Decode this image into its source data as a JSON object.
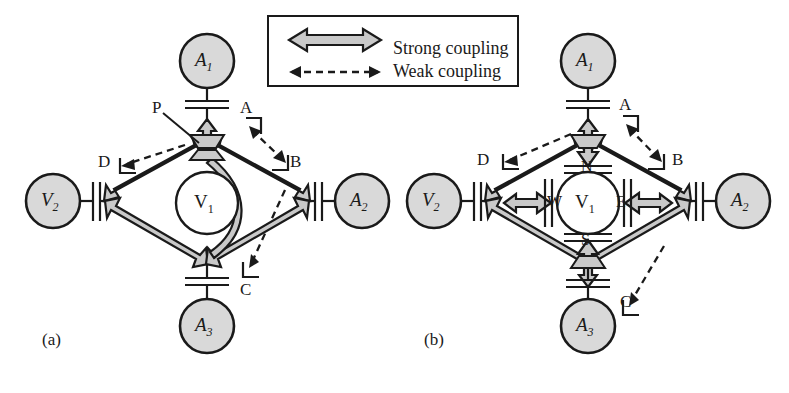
{
  "figure": {
    "type": "circuit-coupling-diagram",
    "panels": [
      {
        "id": "a",
        "panel_label": "(a)",
        "center_node": "V1",
        "center_node_label": "V",
        "center_node_sub": "1",
        "description": "All four corner ports converge on a single common plate P at the top hub",
        "nodes": [
          {
            "id": "A1",
            "label": "A",
            "sub": "1",
            "position": "top",
            "fill": "#d9d9d9"
          },
          {
            "id": "A2",
            "label": "A",
            "sub": "2",
            "position": "right",
            "fill": "#d9d9d9"
          },
          {
            "id": "A3",
            "label": "A",
            "sub": "3",
            "position": "bottom",
            "fill": "#d9d9d9"
          },
          {
            "id": "V2",
            "label": "V",
            "sub": "2",
            "position": "left",
            "fill": "#d9d9d9"
          }
        ],
        "ports": [
          {
            "id": "A",
            "label": "A",
            "position": "top-right"
          },
          {
            "id": "B",
            "label": "B",
            "position": "right-upper"
          },
          {
            "id": "C",
            "label": "C",
            "position": "bottom-right"
          },
          {
            "id": "D",
            "label": "D",
            "position": "left-upper"
          },
          {
            "id": "P",
            "label": "P",
            "position": "hub-top-left"
          }
        ],
        "strong_couplings": [
          {
            "from": "hub",
            "to": "D"
          },
          {
            "from": "hub",
            "to": "B"
          },
          {
            "from": "D",
            "to": "C"
          },
          {
            "from": "B",
            "to": "C"
          },
          {
            "from": "hub",
            "to": "A"
          }
        ],
        "weak_couplings": [
          {
            "from": "P",
            "to": "D"
          },
          {
            "from": "A",
            "to": "B"
          },
          {
            "from": "B",
            "to": "C"
          }
        ]
      },
      {
        "id": "b",
        "panel_label": "(b)",
        "center_node": "V1",
        "center_node_label": "V",
        "center_node_sub": "1",
        "description": "Center node has four separate plates N, S, E, W, one per direction",
        "nodes": [
          {
            "id": "A1",
            "label": "A",
            "sub": "1",
            "position": "top",
            "fill": "#d9d9d9"
          },
          {
            "id": "A2",
            "label": "A",
            "sub": "2",
            "position": "right",
            "fill": "#d9d9d9"
          },
          {
            "id": "A3",
            "label": "A",
            "sub": "3",
            "position": "bottom",
            "fill": "#d9d9d9"
          },
          {
            "id": "V2",
            "label": "V",
            "sub": "2",
            "position": "left",
            "fill": "#d9d9d9"
          }
        ],
        "ports": [
          {
            "id": "A",
            "label": "A",
            "position": "top-right"
          },
          {
            "id": "B",
            "label": "B",
            "position": "right-upper"
          },
          {
            "id": "C",
            "label": "C",
            "position": "bottom-right"
          },
          {
            "id": "D",
            "label": "D",
            "position": "left-upper"
          }
        ],
        "center_plates": [
          {
            "id": "N",
            "label": "N",
            "position": "north"
          },
          {
            "id": "S",
            "label": "S",
            "position": "south"
          },
          {
            "id": "E",
            "label": "E",
            "position": "east"
          },
          {
            "id": "W",
            "label": "W",
            "position": "west"
          }
        ],
        "strong_couplings": [
          {
            "from": "hub-N",
            "to": "D"
          },
          {
            "from": "hub-N",
            "to": "B"
          },
          {
            "from": "D",
            "to": "S"
          },
          {
            "from": "B",
            "to": "S"
          },
          {
            "from": "hub",
            "to": "N"
          },
          {
            "from": "hub",
            "to": "S"
          },
          {
            "from": "hub",
            "to": "E"
          },
          {
            "from": "hub",
            "to": "W"
          }
        ],
        "weak_couplings": [
          {
            "from": "A",
            "to": "D"
          },
          {
            "from": "A",
            "to": "B"
          },
          {
            "from": "B",
            "to": "C"
          }
        ]
      }
    ],
    "legend": {
      "position": "top-center",
      "items": [
        {
          "id": "strong",
          "label": "Strong coupling",
          "arrow": "double-head-solid-filled"
        },
        {
          "id": "weak",
          "label": "Weak coupling",
          "arrow": "double-head-dashed"
        }
      ]
    },
    "colors": {
      "node_fill": "#d9d9d9",
      "arrow_fill": "#c9c9c9",
      "stroke": "#1a1a1a",
      "background": "#ffffff",
      "center_fill": "#ffffff"
    }
  }
}
